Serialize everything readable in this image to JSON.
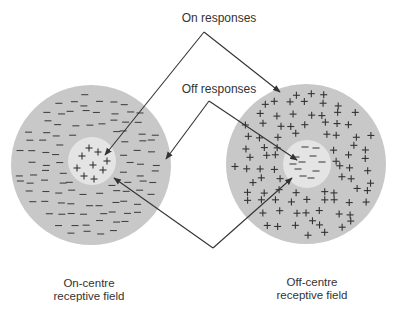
{
  "diagram": {
    "labels": {
      "on_responses": "On responses",
      "off_responses": "Off responses"
    },
    "captions": {
      "left_line1": "On-centre",
      "left_line2": "receptive field",
      "right_line1": "Off-centre",
      "right_line2": "receptive field"
    },
    "colors": {
      "surround": "#c8c8c8",
      "centre": "#e4e4e4",
      "line": "#333333",
      "text": "#333333"
    },
    "fields": [
      {
        "name": "on-centre",
        "centre_sign": "+",
        "surround_sign": "−",
        "cx": 91,
        "cy": 165,
        "outer_r": 80,
        "inner_r": 24
      },
      {
        "name": "off-centre",
        "centre_sign": "−",
        "surround_sign": "+",
        "cx": 306,
        "cy": 164,
        "outer_r": 80,
        "inner_r": 24
      }
    ],
    "arrows": {
      "on_responses": {
        "apex": [
          204,
          32
        ],
        "to_left": [
          105,
          155
        ],
        "to_right": [
          280,
          92
        ]
      },
      "off_responses": {
        "apex": [
          209,
          101
        ],
        "to_left": [
          166,
          159
        ],
        "to_right": [
          297,
          160
        ]
      },
      "bottom": {
        "apex": [
          213,
          248
        ],
        "to_left": [
          114,
          178
        ],
        "to_right": [
          292,
          178
        ]
      }
    }
  }
}
